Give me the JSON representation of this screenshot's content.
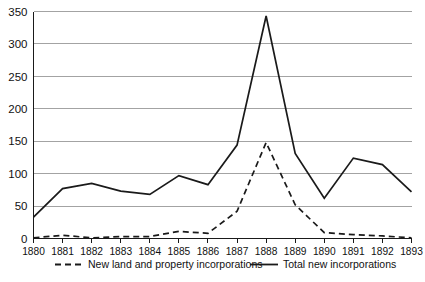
{
  "chart_data": {
    "type": "line",
    "title": "",
    "xlabel": "",
    "ylabel": "",
    "categories": [
      "1880",
      "1881",
      "1882",
      "1883",
      "1884",
      "1885",
      "1886",
      "1887",
      "1888",
      "1889",
      "1890",
      "1891",
      "1892",
      "1893"
    ],
    "xticklabels": [
      "1880",
      "1881",
      "1882",
      "1883",
      "1884",
      "1885",
      "1886",
      "1887",
      "1888",
      "1889",
      "1890",
      "1891",
      "1892",
      "1893"
    ],
    "yticklabels": [
      "0",
      "50",
      "100",
      "150",
      "200",
      "250",
      "300",
      "350"
    ],
    "yticks": [
      0,
      50,
      100,
      150,
      200,
      250,
      300,
      350
    ],
    "ylim": [
      0,
      350
    ],
    "grid": "horizontal",
    "legend_position": "bottom",
    "series": [
      {
        "name": "New land and property incorporations",
        "style": "dashed",
        "color": "#1a1a1a",
        "values": [
          1,
          5,
          1,
          3,
          3,
          11,
          8,
          42,
          148,
          52,
          9,
          6,
          4,
          1
        ]
      },
      {
        "name": "Total new incorporations",
        "style": "solid",
        "color": "#1a1a1a",
        "values": [
          33,
          77,
          85,
          73,
          68,
          97,
          83,
          144,
          343,
          131,
          62,
          124,
          114,
          72
        ]
      }
    ]
  },
  "legend": {
    "entries": [
      {
        "label": "New land and property incorporations",
        "style": "dashed"
      },
      {
        "label": "Total new incorporations",
        "style": "solid"
      }
    ]
  },
  "colors": {
    "ink": "#1a1a1a",
    "grid": "#999999",
    "background": "#ffffff"
  }
}
